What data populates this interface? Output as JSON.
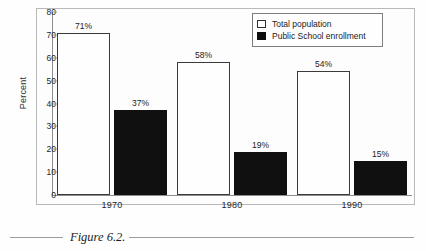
{
  "figure": {
    "caption": "Figure 6.2."
  },
  "chart_data": {
    "type": "bar",
    "title": "",
    "subtitle": "",
    "xlabel": "",
    "ylabel": "Percent",
    "categories": [
      "1970",
      "1980",
      "1990"
    ],
    "series": [
      {
        "name": "Total population",
        "values": [
          71,
          58,
          54
        ],
        "data_labels": [
          "71%",
          "58%",
          "54%"
        ],
        "fill": "#ffffff",
        "stroke": "#3a3a3a"
      },
      {
        "name": "Public School enrollment",
        "values": [
          37,
          19,
          15
        ],
        "data_labels": [
          "37%",
          "19%",
          "15%"
        ],
        "fill": "#101010",
        "stroke": "#101010"
      }
    ],
    "ylim": [
      0,
      80
    ],
    "yticks": [
      0,
      10,
      20,
      30,
      40,
      50,
      60,
      70,
      80
    ],
    "ytick_labels": [
      "0",
      "10",
      "20",
      "30",
      "40",
      "50",
      "60",
      "70",
      "80"
    ],
    "grid": false,
    "legend_position": "top-right",
    "value_suffix": "%"
  },
  "legend": {
    "items": [
      {
        "label": "Total population",
        "swatch": "open-square-swatch"
      },
      {
        "label": "Public School enrollment",
        "swatch": "filled-square-swatch"
      }
    ]
  }
}
